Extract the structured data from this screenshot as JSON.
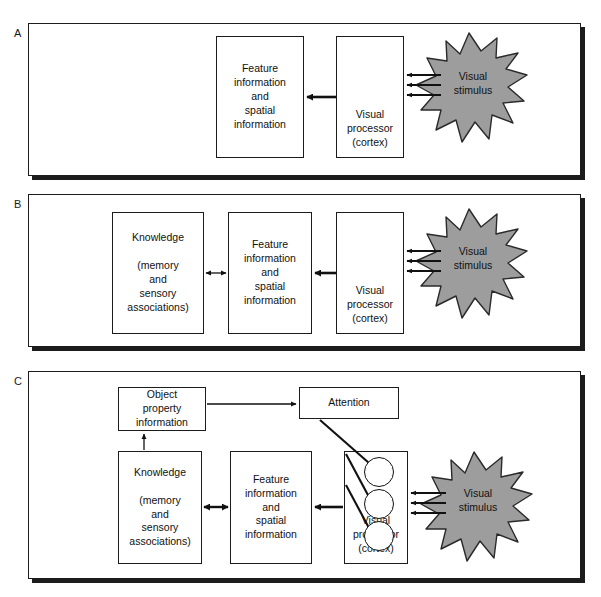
{
  "figure": {
    "panels": [
      {
        "label": "A",
        "nodes": {
          "feature": "Feature\ninformation\nand\nspatial\ninformation",
          "processor": "Visual\nprocessor\n(cortex)",
          "stimulus": "Visual\nstimulus"
        },
        "arrows": [
          {
            "name": "processor-to-feature",
            "style": "bold-left"
          },
          {
            "name": "stimulus-to-processor",
            "style": "triple-bold-left"
          }
        ]
      },
      {
        "label": "B",
        "nodes": {
          "knowledge": "Knowledge\n\n(memory\nand\nsensory\nassociations)",
          "feature": "Feature\ninformation\nand\nspatial\ninformation",
          "processor": "Visual\nprocessor\n(cortex)",
          "stimulus": "Visual\nstimulus"
        },
        "arrows": [
          {
            "name": "knowledge-feature-bidirectional",
            "style": "thin-double"
          },
          {
            "name": "processor-to-feature",
            "style": "bold-left"
          },
          {
            "name": "stimulus-to-processor",
            "style": "triple-bold-left"
          }
        ]
      },
      {
        "label": "C",
        "nodes": {
          "object_property": "Object\nproperty\ninformation",
          "attention": "Attention",
          "knowledge": "Knowledge\n\n(memory\nand\nsensory\nassociations)",
          "feature": "Feature\ninformation\nand\nspatial\ninformation",
          "processor": "Visual\nprocessor\n(cortex)",
          "stimulus": "Visual\nstimulus"
        },
        "arrows": [
          {
            "name": "object-property-to-attention",
            "style": "thin-right"
          },
          {
            "name": "knowledge-to-object-property",
            "style": "thin-up"
          },
          {
            "name": "knowledge-feature-bidirectional",
            "style": "bold-double"
          },
          {
            "name": "processor-to-feature",
            "style": "bold-left"
          },
          {
            "name": "stimulus-to-processor",
            "style": "triple-bold-left"
          },
          {
            "name": "attention-to-unit",
            "style": "plain-diagonal"
          }
        ],
        "units": [
          "unit-1",
          "unit-2",
          "unit-3"
        ]
      }
    ]
  },
  "colors": {
    "stroke": "#1c1c1c",
    "stimulus_fill": "#9d9d9d",
    "stimulus_stroke": "#2a2a2a",
    "background": "#ffffff",
    "text": "#111111"
  }
}
